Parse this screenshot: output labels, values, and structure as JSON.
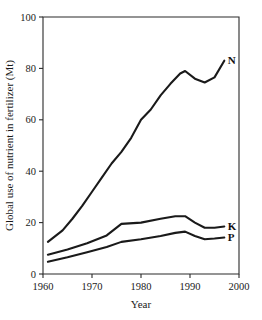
{
  "chart_data": {
    "type": "line",
    "title": "",
    "xlabel": "Year",
    "ylabel": "Global use of nutrient in fertilizer (Mt)",
    "xlim": [
      1960,
      2000
    ],
    "ylim": [
      0,
      100
    ],
    "xticks": [
      1960,
      1970,
      1980,
      1990,
      2000
    ],
    "yticks": [
      0,
      20,
      40,
      60,
      80,
      100
    ],
    "xtick_labels": [
      "1960",
      "1970",
      "1980",
      "1990",
      "2000"
    ],
    "ytick_labels": [
      "0",
      "20",
      "40",
      "60",
      "80",
      "100"
    ],
    "grid": false,
    "legend_position": "inline-right-end-labels",
    "series": [
      {
        "name": "N",
        "label": "N",
        "color": "#1a1a1a",
        "x": [
          1961,
          1964,
          1966,
          1968,
          1970,
          1972,
          1974,
          1976,
          1978,
          1980,
          1982,
          1984,
          1986,
          1988,
          1989,
          1991,
          1993,
          1995,
          1997
        ],
        "values": [
          12.5,
          17.0,
          21.5,
          26.5,
          32.0,
          37.5,
          43.0,
          47.5,
          53.0,
          60.0,
          64.0,
          69.5,
          74.0,
          78.0,
          79.0,
          76.0,
          74.5,
          76.5,
          83.0
        ]
      },
      {
        "name": "K",
        "label": "K",
        "color": "#1a1a1a",
        "x": [
          1961,
          1965,
          1969,
          1973,
          1976,
          1980,
          1984,
          1987,
          1989,
          1991,
          1993,
          1995,
          1997
        ],
        "values": [
          7.5,
          9.5,
          12.0,
          15.0,
          19.5,
          20.0,
          21.5,
          22.5,
          22.5,
          20.0,
          18.0,
          18.0,
          18.5
        ]
      },
      {
        "name": "P",
        "label": "P",
        "color": "#1a1a1a",
        "x": [
          1961,
          1965,
          1969,
          1973,
          1976,
          1980,
          1984,
          1987,
          1989,
          1991,
          1993,
          1995,
          1997
        ],
        "values": [
          4.8,
          6.5,
          8.5,
          10.5,
          12.5,
          13.5,
          14.8,
          16.0,
          16.5,
          14.8,
          13.5,
          13.8,
          14.2
        ]
      }
    ]
  },
  "geometry": {
    "plot_left": 43,
    "plot_right": 239,
    "plot_top": 17,
    "plot_bottom": 274
  }
}
